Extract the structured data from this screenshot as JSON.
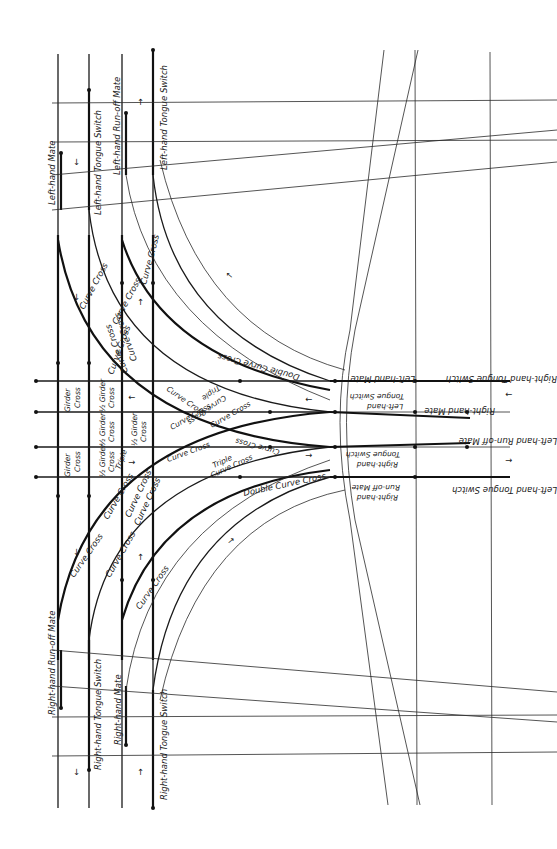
{
  "colors": {
    "background": "#ffffff",
    "ink": "#111111"
  },
  "labels": {
    "left_hand_mate": "Left-hand Mate",
    "left_hand_tongue_switch": "Left-hand Tongue Switch",
    "left_hand_run_off_mate": "Left-hand Run-off Mate",
    "left_hand_tongue_switch_2": "Left-hand Tongue Switch",
    "right_hand_run_off_mate": "Right-hand Run-off Mate",
    "right_hand_tongue_switch": "Right-hand Tongue Switch",
    "right_hand_mate": "Right-hand Mate",
    "right_hand_tongue_switch_2": "Right-hand Tongue Switch",
    "curve_cross": "Curve Cross",
    "girder": "Girder",
    "cross": "Cross",
    "half_girder": "½ Girder",
    "triple": "Triple",
    "double_curve_cross": "Double Curve Cross",
    "right_hand_tongue_switch_east": "Right-hand Tongue Switch",
    "left_hand_mate_east": "Left-hand Mate",
    "left_hand": "Left-hand",
    "tongue_switch": "Tongue Switch",
    "right_hand_mate_east": "Right-hand Mate",
    "left_hand_run_off_mate_east": "Left-hand Run-off Mate",
    "right_hand": "Right-hand",
    "run_off_mate": "Run-off Mate",
    "left_hand_tongue_switch_east": "Left-hand Tongue Switch"
  },
  "arrows": {
    "up": "↑",
    "down": "↓",
    "left": "←",
    "right": "→"
  }
}
